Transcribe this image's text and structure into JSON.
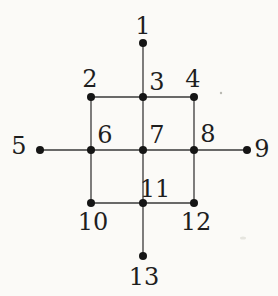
{
  "figure": {
    "type": "graph-diagram",
    "background_color": "#fbfaf7",
    "edge_color": "#3a3a3a",
    "node_color": "#151515",
    "label_color": "#1e1e1e",
    "node_radius": 4,
    "edge_width": 1.3,
    "label_font_size": 24,
    "nodes": [
      {
        "id": "1",
        "label": "1",
        "x": 143,
        "y": 43,
        "label_x": 143,
        "label_y": 26
      },
      {
        "id": "2",
        "label": "2",
        "x": 91,
        "y": 97,
        "label_x": 90,
        "label_y": 79
      },
      {
        "id": "3",
        "label": "3",
        "x": 143,
        "y": 97,
        "label_x": 157,
        "label_y": 82
      },
      {
        "id": "4",
        "label": "4",
        "x": 194,
        "y": 97,
        "label_x": 193,
        "label_y": 79
      },
      {
        "id": "5",
        "label": "5",
        "x": 40,
        "y": 150,
        "label_x": 19,
        "label_y": 146
      },
      {
        "id": "6",
        "label": "6",
        "x": 91,
        "y": 150,
        "label_x": 105,
        "label_y": 135
      },
      {
        "id": "7",
        "label": "7",
        "x": 143,
        "y": 150,
        "label_x": 157,
        "label_y": 135
      },
      {
        "id": "8",
        "label": "8",
        "x": 194,
        "y": 150,
        "label_x": 208,
        "label_y": 134
      },
      {
        "id": "9",
        "label": "9",
        "x": 247,
        "y": 150,
        "label_x": 262,
        "label_y": 149
      },
      {
        "id": "10",
        "label": "10",
        "x": 91,
        "y": 203,
        "label_x": 93,
        "label_y": 222
      },
      {
        "id": "11",
        "label": "11",
        "x": 143,
        "y": 203,
        "label_x": 155,
        "label_y": 189
      },
      {
        "id": "12",
        "label": "12",
        "x": 194,
        "y": 203,
        "label_x": 196,
        "label_y": 222
      },
      {
        "id": "13",
        "label": "13",
        "x": 143,
        "y": 256,
        "label_x": 144,
        "label_y": 277
      }
    ],
    "edges": [
      [
        "1",
        "3"
      ],
      [
        "2",
        "3"
      ],
      [
        "3",
        "4"
      ],
      [
        "2",
        "6"
      ],
      [
        "3",
        "7"
      ],
      [
        "4",
        "8"
      ],
      [
        "5",
        "6"
      ],
      [
        "6",
        "7"
      ],
      [
        "7",
        "8"
      ],
      [
        "8",
        "9"
      ],
      [
        "6",
        "10"
      ],
      [
        "7",
        "11"
      ],
      [
        "8",
        "12"
      ],
      [
        "10",
        "11"
      ],
      [
        "11",
        "12"
      ],
      [
        "11",
        "13"
      ]
    ],
    "specks": [
      {
        "x": 221,
        "y": 93,
        "rx": 1.2,
        "ry": 1.2,
        "color": "#b9b9b2"
      },
      {
        "x": 243,
        "y": 238,
        "rx": 3.0,
        "ry": 1.5,
        "color": "#e6e5df"
      }
    ]
  }
}
